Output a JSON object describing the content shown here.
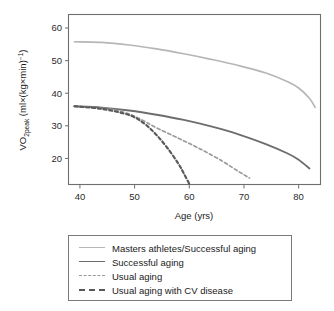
{
  "chart_data": {
    "type": "line",
    "title": "",
    "xlabel": "Age (yrs)",
    "ylabel": "VO2peak (ml×(kg×min)⁻¹)",
    "ylabel_parts": {
      "prefix": "VO",
      "sub": "2peak",
      "unit": " (ml×(kg×min)",
      "sup": "−1",
      "suffix": ")"
    },
    "xlim": [
      38,
      84
    ],
    "ylim": [
      12,
      64
    ],
    "xticks": [
      40,
      50,
      60,
      70,
      80
    ],
    "yticks": [
      20,
      30,
      40,
      50,
      60
    ],
    "grid": false,
    "legend_position": "below",
    "series": [
      {
        "name": "Masters athletes/Successful aging",
        "style": "solid",
        "color": "#b6b6b6",
        "width": 1.7,
        "x": [
          39,
          44,
          49,
          54,
          59,
          64,
          69,
          74,
          78,
          80,
          82,
          83
        ],
        "y": [
          55.8,
          55.6,
          54.8,
          53.6,
          52.1,
          50.4,
          48.5,
          46.2,
          43.5,
          41.6,
          38.4,
          35.7
        ]
      },
      {
        "name": "Successful aging",
        "style": "solid",
        "color": "#6d6d6d",
        "width": 1.8,
        "x": [
          39,
          44,
          49,
          54,
          59,
          64,
          69,
          74,
          78,
          80,
          82
        ],
        "y": [
          36.0,
          35.6,
          34.7,
          33.4,
          31.8,
          29.8,
          27.4,
          24.4,
          21.5,
          19.6,
          16.9
        ]
      },
      {
        "name": "Usual aging",
        "style": "dashed",
        "color": "#9a9a9a",
        "width": 1.7,
        "x": [
          39,
          44,
          48,
          51,
          54,
          58,
          62,
          66,
          69,
          71
        ],
        "y": [
          36.0,
          35.4,
          34.2,
          32.1,
          29.4,
          26.2,
          22.9,
          19.2,
          16.0,
          14.0
        ]
      },
      {
        "name": "Usual aging with CV disease",
        "style": "dashed",
        "color": "#585858",
        "width": 2.1,
        "x": [
          39,
          44,
          48,
          50,
          52,
          54,
          56,
          58,
          59,
          60
        ],
        "y": [
          36.0,
          35.2,
          33.8,
          32.6,
          30.4,
          27.2,
          23.2,
          18.4,
          15.4,
          12.2
        ]
      }
    ]
  },
  "legend": {
    "items": [
      {
        "label": "Masters athletes/Successful aging",
        "style": "solid",
        "color": "#b6b6b6",
        "thickness": "1.6px"
      },
      {
        "label": "Successful aging",
        "style": "solid",
        "color": "#6d6d6d",
        "thickness": "1.8px"
      },
      {
        "label": "Usual aging",
        "style": "dashed",
        "color": "#9a9a9a",
        "thickness": "1.6px"
      },
      {
        "label": "Usual aging with CV disease",
        "style": "dashed",
        "color": "#585858",
        "thickness": "2px"
      }
    ]
  }
}
